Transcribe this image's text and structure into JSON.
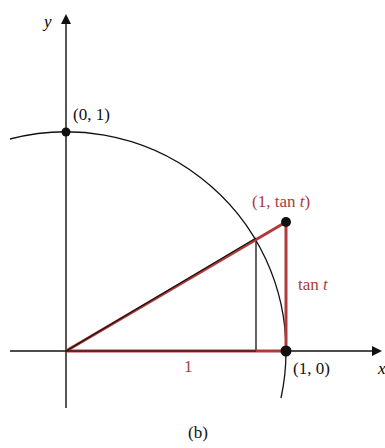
{
  "figure": {
    "caption": "(b)",
    "axes": {
      "x_label": "x",
      "y_label": "y"
    },
    "points": {
      "top": "(0, 1)",
      "tan_point_prefix": "(1, tan ",
      "tan_point_var": "t",
      "tan_point_suffix": ")",
      "x_intercept": "(1, 0)"
    },
    "segment_labels": {
      "base": "1",
      "tan_prefix": "tan ",
      "tan_var": "t"
    },
    "colors": {
      "accent": "#b03a3a",
      "ink": "#111111"
    }
  }
}
